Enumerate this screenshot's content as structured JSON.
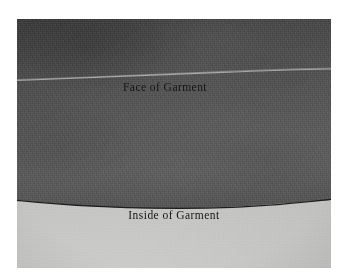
{
  "figure": {
    "kind": "photograph",
    "labels": {
      "face": "Face of Garment",
      "inside": "Inside of Garment"
    },
    "colors": {
      "page_background": "#ffffff",
      "fabric_dark": "#575757",
      "fabric_dark_shadow": "#4a4a4a",
      "ground_light": "#c8c8c6",
      "line_dark": "#1a1a1a",
      "crease_light": "#a9a9a7",
      "text": "#141414"
    },
    "regions": [
      {
        "name": "face-of-garment",
        "tone": "dark gray textured fabric"
      },
      {
        "name": "inside-of-garment",
        "tone": "light gray textured ground"
      }
    ],
    "features": [
      {
        "name": "fold-crease",
        "description": "light diagonal crease across the face of the garment"
      },
      {
        "name": "hem-edge-line",
        "description": "dark curved hem edge separating face from inside"
      }
    ]
  }
}
